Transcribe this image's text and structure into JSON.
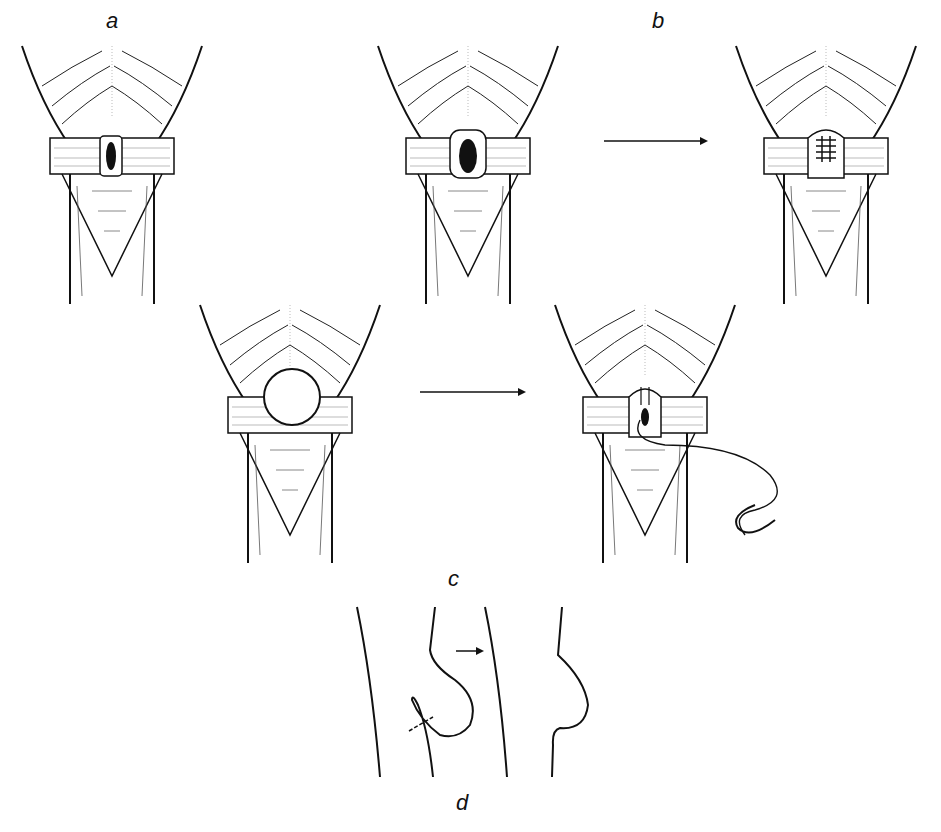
{
  "figure": {
    "type": "surgical illustration",
    "panel_labels": {
      "a": "a",
      "b": "b",
      "c": "c",
      "d": "d"
    },
    "colors": {
      "ink": "#111111",
      "background": "#ffffff",
      "shading": "#bbbbbb"
    },
    "panels": [
      {
        "id": "a",
        "description": "small defect in ring",
        "icon": "small-hernia-defect"
      },
      {
        "id": "b1",
        "description": "enlarged defect",
        "icon": "enlarged-defect"
      },
      {
        "id": "b2",
        "description": "sutured closure",
        "icon": "sutured-closure"
      },
      {
        "id": "c1",
        "description": "protruding sac",
        "icon": "hernia-sac"
      },
      {
        "id": "c2",
        "description": "suture with needle",
        "icon": "suture-needle"
      },
      {
        "id": "d",
        "description": "schematic ligation profile",
        "icon": "ligation-schematic"
      }
    ]
  }
}
